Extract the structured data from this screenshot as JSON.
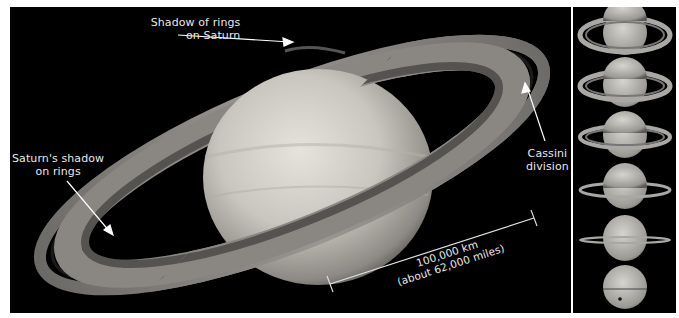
{
  "figure": {
    "main_panel": {
      "subject": "Saturn and its rings",
      "annotations": {
        "shadow_rings_on_saturn": {
          "line1": "Shadow of rings",
          "line2": "on Saturn"
        },
        "saturn_shadow_on_rings": {
          "line1": "Saturn's shadow",
          "line2": "on rings"
        },
        "cassini_division": {
          "line1": "Cassini",
          "line2": "division"
        }
      },
      "scale_bar": {
        "line1": "100,000 km",
        "line2": "(about 62,000 miles)"
      }
    },
    "side_strip": {
      "subject": "Saturn ring tilt sequence",
      "frames": [
        {
          "tilt": "wide-open rings"
        },
        {
          "tilt": "open rings"
        },
        {
          "tilt": "moderately open rings"
        },
        {
          "tilt": "narrow rings"
        },
        {
          "tilt": "nearly edge-on rings"
        },
        {
          "tilt": "edge-on rings"
        }
      ]
    },
    "colors": {
      "background": "#000000",
      "border": "#ffffff",
      "label": "#e8e8e8"
    }
  }
}
